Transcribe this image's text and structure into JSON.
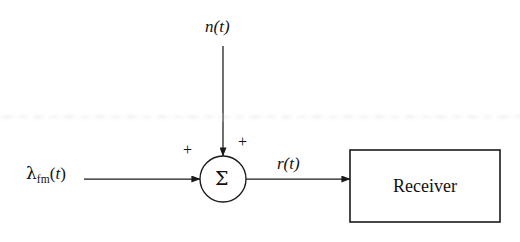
{
  "figure": {
    "type": "block-diagram",
    "background_color": "#ffffff",
    "stroke_color": "#1a1a1a"
  },
  "labels": {
    "noise_input": "n(t)",
    "signal_input_symbol": "λ",
    "signal_input_subscript": "fm",
    "signal_input_arg_open": "(",
    "signal_input_arg_var": "t",
    "signal_input_arg_close": ")",
    "summer_symbol": "Σ",
    "received_signal": "r(t)",
    "plus_from_signal": "+",
    "plus_from_noise": "+",
    "receiver_block": "Receiver"
  },
  "nodes": [
    {
      "id": "summer",
      "kind": "circle-adder",
      "label": "Σ",
      "cx": 223,
      "cy": 179,
      "r": 23
    },
    {
      "id": "receiver",
      "kind": "rect-block",
      "label": "Receiver",
      "x": 350,
      "y": 150,
      "width": 150,
      "height": 72
    }
  ],
  "edges": [
    {
      "id": "signal-to-summer",
      "from": "λ_fm(t)",
      "to": "summer",
      "orientation": "horizontal",
      "sign": "+"
    },
    {
      "id": "noise-to-summer",
      "from": "n(t)",
      "to": "summer",
      "orientation": "vertical",
      "sign": "+"
    },
    {
      "id": "summer-to-receiver",
      "from": "summer",
      "to": "receiver",
      "orientation": "horizontal",
      "label": "r(t)"
    }
  ]
}
